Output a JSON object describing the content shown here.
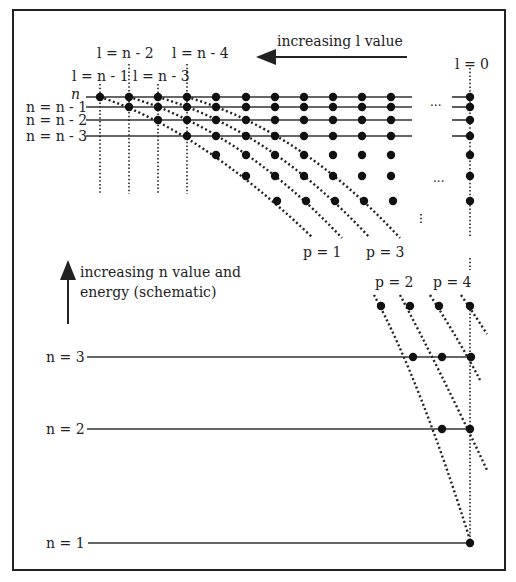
{
  "diagram": {
    "top_labels": {
      "l_n_minus_2": "l = n - 2",
      "l_n_minus_4": "l = n - 4",
      "l_n_minus_1": "l = n - 1",
      "l_n_minus_3": "l = n - 3",
      "l_zero": "l = 0",
      "increasing_l": "increasing l value"
    },
    "row_labels": [
      "n",
      "n = n - 1",
      "n = n - 2",
      "n = n - 3"
    ],
    "p_labels_upper": [
      "p = 1",
      "p = 3"
    ],
    "p_labels_lower": [
      "p = 2",
      "p = 4"
    ],
    "energy_caption_line1": "increasing n value and",
    "energy_caption_line2": "energy (schematic)",
    "level_labels": [
      "n = 3",
      "n = 2",
      "n = 1"
    ],
    "ellipsis": "..."
  }
}
